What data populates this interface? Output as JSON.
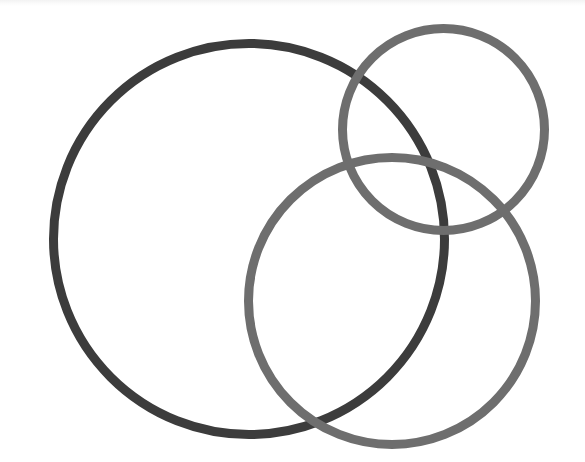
{
  "diagram": {
    "type": "venn",
    "background": "#ffffff",
    "circles": [
      {
        "id": "large-left",
        "label": "",
        "cx": 249,
        "cy": 239,
        "r": 195.5,
        "stroke": "#3c3c3c",
        "stroke_width": 9
      },
      {
        "id": "small-top-right",
        "label": "",
        "cx": 443.5,
        "cy": 129.5,
        "r": 101,
        "stroke": "#6e6e6e",
        "stroke_width": 9
      },
      {
        "id": "medium-bottom-right",
        "label": "",
        "cx": 392,
        "cy": 301,
        "r": 143.5,
        "stroke": "#6e6e6e",
        "stroke_width": 9
      }
    ]
  }
}
